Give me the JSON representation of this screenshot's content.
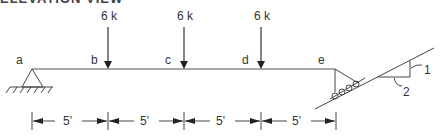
{
  "title_fragment": "ELEVATION VIEW",
  "beam": {
    "points": [
      "a",
      "b",
      "c",
      "d",
      "e"
    ],
    "segment_lengths": [
      "5'",
      "5'",
      "5'",
      "5'"
    ]
  },
  "loads": [
    {
      "at": "b",
      "label": "6 k"
    },
    {
      "at": "c",
      "label": "6 k"
    },
    {
      "at": "d",
      "label": "6 k"
    }
  ],
  "supports": {
    "a": "pin",
    "e": "roller on inclined surface"
  },
  "slope": {
    "rise": "1",
    "run": "2"
  },
  "colors": {
    "line": "#333333",
    "text": "#333333"
  }
}
